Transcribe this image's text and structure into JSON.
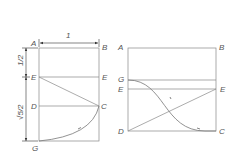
{
  "left_figure": {
    "labels": {
      "A": "A",
      "B": "B",
      "E_left": "E",
      "E_right": "E",
      "D": "D",
      "C": "C",
      "G": "G"
    },
    "dimensions": {
      "width": "1",
      "upper": "1/2",
      "lower": "√5/2"
    }
  },
  "right_figure": {
    "labels": {
      "A": "A",
      "B": "B",
      "G": "G",
      "E_left": "E",
      "E_right": "E",
      "D": "D",
      "C": "C"
    }
  }
}
